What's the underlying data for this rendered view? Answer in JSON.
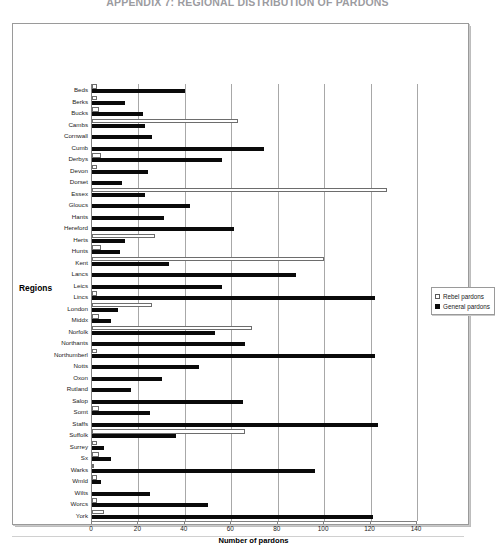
{
  "document": {
    "title": "APPENDIX 7: REGIONAL DISTRIBUTION OF PARDONS"
  },
  "chart_data": {
    "type": "bar",
    "orientation": "horizontal",
    "title": "APPENDIX 7: REGIONAL DISTRIBUTION OF PARDONS",
    "xlabel": "Number of pardons",
    "ylabel": "Regions",
    "xlim": [
      0,
      140
    ],
    "xticks": [
      0,
      20,
      40,
      60,
      80,
      100,
      120,
      140
    ],
    "grid": true,
    "legend_position": "right",
    "categories": [
      "Beds",
      "Berks",
      "Bucks",
      "Cambs",
      "Cornwall",
      "Cumb",
      "Derbys",
      "Devon",
      "Dorset",
      "Essex",
      "Gloucs",
      "Hants",
      "Hereford",
      "Herts",
      "Hunts",
      "Kent",
      "Lancs",
      "Leics",
      "Lincs",
      "London",
      "Middx",
      "Norfolk",
      "Northants",
      "Northumberl",
      "Notts",
      "Oxon",
      "Rutland",
      "Salop",
      "Somt",
      "Staffs",
      "Suffolk",
      "Surrey",
      "Sx",
      "Warks",
      "Wmld",
      "Wilts",
      "Worcs",
      "York"
    ],
    "series": [
      {
        "name": "Rebel pardons",
        "color": "#ffffff",
        "edge_color": "#6d6d6d",
        "values": [
          2,
          2,
          3,
          63,
          0,
          0,
          4,
          2,
          0,
          127,
          0,
          0,
          0,
          27,
          4,
          100,
          0,
          0,
          2,
          26,
          3,
          69,
          0,
          2,
          0,
          0,
          0,
          0,
          3,
          0,
          66,
          2,
          3,
          1,
          2,
          0,
          2,
          5
        ]
      },
      {
        "name": "General pardons",
        "color": "#0a0a0a",
        "values": [
          40,
          14,
          22,
          23,
          26,
          74,
          56,
          24,
          13,
          23,
          42,
          31,
          61,
          14,
          12,
          33,
          88,
          56,
          122,
          11,
          8,
          53,
          66,
          122,
          46,
          30,
          17,
          65,
          25,
          123,
          36,
          5,
          8,
          96,
          4,
          25,
          50,
          121
        ]
      }
    ]
  },
  "legend": {
    "items": [
      {
        "label": "Rebel pardons",
        "swatch": "hollow-square"
      },
      {
        "label": "General pardons",
        "swatch": "filled-square"
      }
    ]
  },
  "axis": {
    "x_title": "Number of pardons",
    "y_title": "Regions"
  }
}
